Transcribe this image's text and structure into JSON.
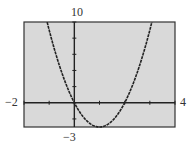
{
  "window": {
    "xmin": "-2",
    "xmax": "4",
    "ymin": "-3",
    "ymax": "10"
  },
  "colors": {
    "screen": "#d9d9d9",
    "axis": "#222222",
    "curve": "#222222",
    "frame": "#333333"
  },
  "chart_data": {
    "type": "line",
    "title": "",
    "xlabel": "",
    "ylabel": "",
    "xlim": [
      -2,
      4
    ],
    "ylim": [
      -3,
      10
    ],
    "grid": false,
    "x_tick_step": 1,
    "y_tick_step": 2,
    "tick_labels": {
      "left": "-2",
      "right": "4",
      "top": "10",
      "bottom": "-3"
    },
    "series": [
      {
        "name": "y = 3x^2 - 6x",
        "x": [
          -1.07,
          -1,
          -0.5,
          0,
          0.5,
          1,
          1.5,
          2,
          2.5,
          3,
          3.07
        ],
        "y": [
          10,
          9,
          3.75,
          0,
          -2.25,
          -3,
          -2.25,
          0,
          3.75,
          9,
          10
        ]
      }
    ]
  }
}
